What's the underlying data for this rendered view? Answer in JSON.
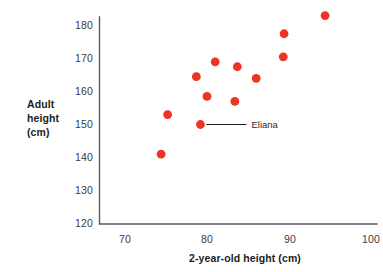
{
  "chart_data": {
    "type": "scatter",
    "title": "",
    "xlabel": "2-year-old height (cm)",
    "ylabel": "Adult height (cm)",
    "ylabel_lines": [
      "Adult",
      "height",
      "(cm)"
    ],
    "xlim": [
      66.5,
      100.5
    ],
    "ylim": [
      120,
      185
    ],
    "xticks": [
      70,
      80,
      90,
      100
    ],
    "yticks": [
      120,
      130,
      140,
      150,
      160,
      170,
      180
    ],
    "xtick_labels": [
      "70",
      "80",
      "90",
      "100"
    ],
    "ytick_labels": [
      "120",
      "130",
      "140",
      "150",
      "160",
      "170",
      "180"
    ],
    "grid": false,
    "legend": "none",
    "marker_color": "#EE3424",
    "axis_color": "#58585D",
    "points": [
      {
        "x": 74.4,
        "y": 141.0,
        "label": ""
      },
      {
        "x": 75.2,
        "y": 153.0,
        "label": ""
      },
      {
        "x": 78.7,
        "y": 164.5,
        "label": ""
      },
      {
        "x": 79.2,
        "y": 150.0,
        "label": "Eliana"
      },
      {
        "x": 80.0,
        "y": 158.5,
        "label": ""
      },
      {
        "x": 81.0,
        "y": 169.0,
        "label": ""
      },
      {
        "x": 83.4,
        "y": 157.0,
        "label": ""
      },
      {
        "x": 83.7,
        "y": 167.5,
        "label": ""
      },
      {
        "x": 86.0,
        "y": 164.0,
        "label": ""
      },
      {
        "x": 89.3,
        "y": 170.5,
        "label": ""
      },
      {
        "x": 89.4,
        "y": 177.5,
        "label": ""
      },
      {
        "x": 94.4,
        "y": 183.0,
        "label": ""
      }
    ],
    "annotations": [
      {
        "text": "Eliana",
        "point_x": 79.2,
        "point_y": 150.0
      }
    ]
  }
}
